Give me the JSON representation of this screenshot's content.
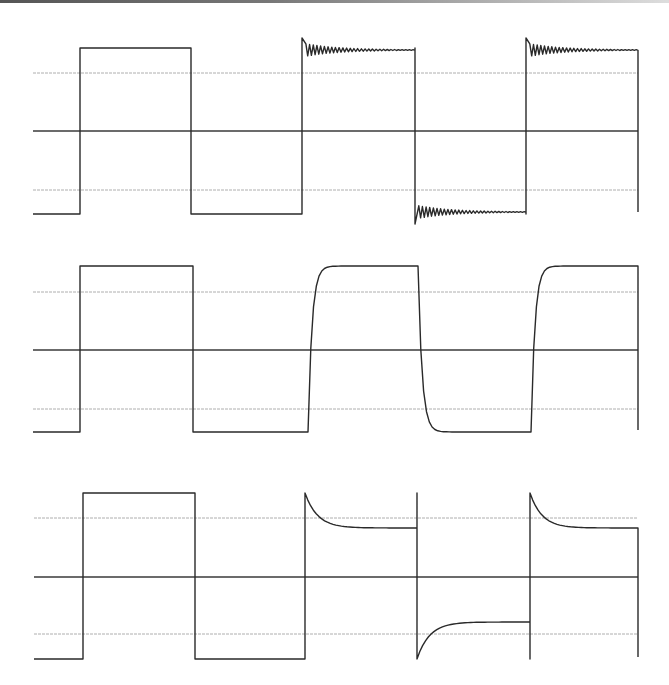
{
  "figure": {
    "colors": {
      "background": "#ffffff",
      "trace": "#2a2a2a",
      "axis": "#3a3a3a",
      "grid": "#9a9a9a"
    }
  },
  "panels": [
    {
      "name": "panel-ringing",
      "x_start": 33,
      "x_end": 638,
      "zero_y": 131,
      "upper_grid_y": 73,
      "lower_grid_y": 190,
      "high_y": 48,
      "low_y": 214,
      "edges": [
        80,
        191,
        302,
        415,
        526,
        638
      ],
      "response": [
        "ideal",
        "ideal",
        "ringing",
        "ringing",
        "ringing"
      ]
    },
    {
      "name": "panel-slow-rise",
      "x_start": 33,
      "x_end": 638,
      "zero_y": 350,
      "upper_grid_y": 292,
      "lower_grid_y": 409,
      "high_y": 266,
      "low_y": 432,
      "edges": [
        80,
        193,
        308,
        418,
        531,
        638
      ],
      "response": [
        "ideal",
        "ideal",
        "rounded",
        "rounded",
        "rounded"
      ]
    },
    {
      "name": "panel-overshoot-decay",
      "x_start": 34,
      "x_end": 638,
      "zero_y": 577,
      "upper_grid_y": 518,
      "lower_grid_y": 634,
      "high_y": 493,
      "low_y": 659,
      "settle_high_y": 528,
      "settle_low_y": 622,
      "edges": [
        83,
        195,
        305,
        417,
        530,
        638
      ],
      "response": [
        "ideal",
        "ideal",
        "decay",
        "decay",
        "decay"
      ]
    }
  ]
}
